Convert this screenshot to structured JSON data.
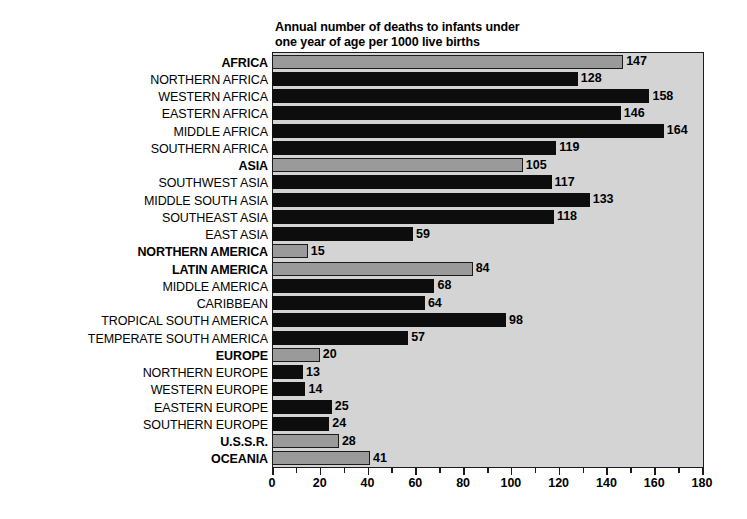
{
  "chart_data": {
    "type": "bar",
    "orientation": "horizontal",
    "title": "Annual number of deaths to infants under\none year of age per 1000 live births",
    "xlabel": "",
    "ylabel": "",
    "xlim": [
      0,
      180
    ],
    "xticks": [
      0,
      20,
      40,
      60,
      80,
      100,
      120,
      140,
      160,
      180
    ],
    "xtick_labels": [
      "0",
      "20",
      "40",
      "60",
      "80",
      "100",
      "120",
      "140",
      "160",
      "180"
    ],
    "minor_tick_step": 10,
    "grid": false,
    "legend": null,
    "colors": {
      "region_bar": "#9a9a9a",
      "subregion_bar": "#0d0d0d",
      "plot_background": "#d4d4d4",
      "frame": "#1b1b1b",
      "page_background": "#ffffff"
    },
    "categories": [
      "AFRICA",
      "NORTHERN AFRICA",
      "WESTERN AFRICA",
      "EASTERN AFRICA",
      "MIDDLE AFRICA",
      "SOUTHERN AFRICA",
      "ASIA",
      "SOUTHWEST ASIA",
      "MIDDLE SOUTH ASIA",
      "SOUTHEAST ASIA",
      "EAST ASIA",
      "NORTHERN AMERICA",
      "LATIN AMERICA",
      "MIDDLE AMERICA",
      "CARIBBEAN",
      "TROPICAL SOUTH AMERICA",
      "TEMPERATE SOUTH AMERICA",
      "EUROPE",
      "NORTHERN EUROPE",
      "WESTERN EUROPE",
      "EASTERN EUROPE",
      "SOUTHERN EUROPE",
      "U.S.S.R.",
      "OCEANIA"
    ],
    "values": [
      147,
      128,
      158,
      146,
      164,
      119,
      105,
      117,
      133,
      118,
      59,
      15,
      84,
      68,
      64,
      98,
      57,
      20,
      13,
      14,
      25,
      24,
      28,
      41
    ],
    "is_major": [
      true,
      false,
      false,
      false,
      false,
      false,
      true,
      false,
      false,
      false,
      false,
      true,
      true,
      false,
      false,
      false,
      false,
      true,
      false,
      false,
      false,
      false,
      true,
      true
    ]
  }
}
